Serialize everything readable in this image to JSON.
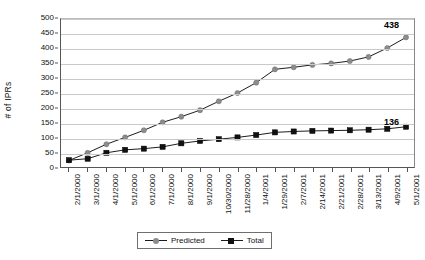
{
  "chart_data": {
    "type": "line",
    "title": "",
    "xlabel": "",
    "ylabel": "# of IPRs",
    "ylim": [
      0,
      500
    ],
    "ytick_step": 50,
    "yticks": [
      0,
      50,
      100,
      150,
      200,
      250,
      300,
      350,
      400,
      450,
      500
    ],
    "grid": true,
    "legend_position": "bottom",
    "categories": [
      "2/1/2000",
      "3/1/2000",
      "4/1/2000",
      "5/1/2000",
      "6/1/2000",
      "7/1/2000",
      "8/1/2000",
      "9/1/2000",
      "10/30/2000",
      "11/28/2000",
      "1/4/2001",
      "1/29/2001",
      "2/7/2001",
      "2/14/2001",
      "2/21/2001",
      "2/28/2001",
      "3/13/2001",
      "4/9/2001",
      "5/1/2001"
    ],
    "series": [
      {
        "name": "Predicted",
        "color": "#8c8c8c",
        "marker": "circle",
        "values": [
          22,
          48,
          77,
          100,
          124,
          151,
          170,
          192,
          222,
          250,
          285,
          330,
          337,
          345,
          350,
          358,
          372,
          402,
          438
        ]
      },
      {
        "name": "Total",
        "color": "#111111",
        "marker": "square",
        "values": [
          23,
          28,
          48,
          58,
          62,
          68,
          80,
          88,
          94,
          100,
          108,
          117,
          120,
          122,
          123,
          124,
          126,
          129,
          136
        ]
      }
    ],
    "annotations": [
      {
        "text": "438",
        "series": "Predicted",
        "category": "5/1/2001",
        "value": 438
      },
      {
        "text": "136",
        "series": "Total",
        "category": "5/1/2001",
        "value": 136
      }
    ]
  },
  "axes": {
    "y_title": "# of IPRs",
    "y_labels": [
      "500",
      "450",
      "400",
      "350",
      "300",
      "250",
      "200",
      "150",
      "100",
      "50",
      "0"
    ],
    "x_labels": [
      "2/1/2000",
      "3/1/2000",
      "4/1/2000",
      "5/1/2000",
      "6/1/2000",
      "7/1/2000",
      "8/1/2000",
      "9/1/2000",
      "10/30/2000",
      "11/28/2000",
      "1/4/2001",
      "1/29/2001",
      "2/7/2001",
      "2/14/2001",
      "2/21/2001",
      "2/28/2001",
      "3/13/2001",
      "4/9/2001",
      "5/1/2001"
    ]
  },
  "legend": {
    "items": [
      {
        "label": "Predicted",
        "color": "#8c8c8c",
        "marker": "circle"
      },
      {
        "label": "Total",
        "color": "#111111",
        "marker": "square"
      }
    ]
  },
  "labels": {
    "predicted_end": "438",
    "total_end": "136"
  }
}
